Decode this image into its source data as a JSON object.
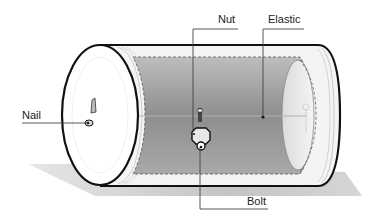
{
  "diagram": {
    "labels": {
      "nail": "Nail",
      "nut": "Nut",
      "elastic": "Elastic",
      "bolt": "Bolt"
    },
    "colors": {
      "outline": "#111111",
      "end_cap": "#ffffff",
      "body_rim": "#f2f2f2",
      "inner_panel": "#9a9a9a",
      "shadow": "#cfcfcf",
      "leader_line": "#444444"
    }
  }
}
